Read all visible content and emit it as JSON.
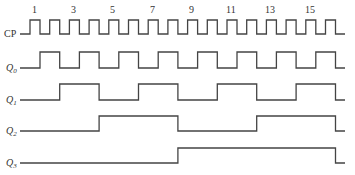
{
  "diagram": {
    "type": "timing-diagram",
    "signals": [
      {
        "id": "cp",
        "label": "CP",
        "sub": ""
      },
      {
        "id": "q0",
        "label": "Q",
        "sub": "0"
      },
      {
        "id": "q1",
        "label": "Q",
        "sub": "1"
      },
      {
        "id": "q2",
        "label": "Q",
        "sub": "2"
      },
      {
        "id": "q3",
        "label": "Q",
        "sub": "3"
      }
    ],
    "pulse_numbers": [
      "1",
      "3",
      "5",
      "7",
      "9",
      "11",
      "13",
      "15"
    ],
    "clock": {
      "pulses": 16,
      "first_rise_x": 30,
      "period_px": 19.7,
      "pulse_width_px": 10,
      "start_x": 20,
      "end_x": 345
    },
    "rows": {
      "cp": {
        "high_y": 20,
        "low_y": 34
      },
      "q0": {
        "high_y": 52,
        "low_y": 68
      },
      "q1": {
        "high_y": 84,
        "low_y": 100
      },
      "q2": {
        "high_y": 116,
        "low_y": 131
      },
      "q3": {
        "high_y": 148,
        "low_y": 163
      }
    },
    "colors": {
      "line": "#444444",
      "text": "#333333",
      "background": "#ffffff"
    }
  }
}
